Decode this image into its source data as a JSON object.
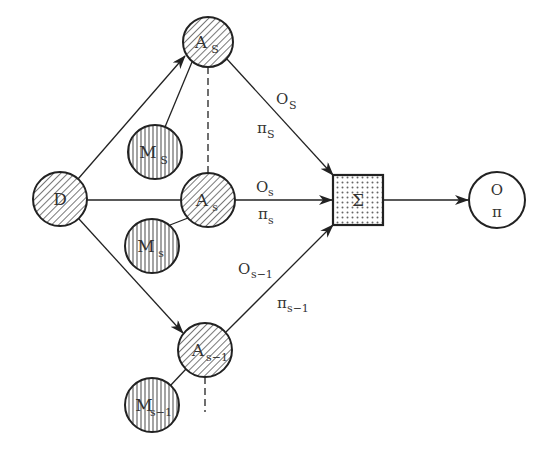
{
  "diagram": {
    "colors": {
      "stroke": "#222222",
      "text": "#333333",
      "background": "#ffffff"
    },
    "nodes": {
      "d": {
        "label": "D"
      },
      "a_top": {
        "label": "A",
        "sub": "S"
      },
      "m_top": {
        "label": "M",
        "sub": "S"
      },
      "a_mid": {
        "label": "A",
        "sub": "s"
      },
      "m_mid": {
        "label": "M",
        "sub": "s"
      },
      "a_bot": {
        "label": "A",
        "sub": "s−1"
      },
      "m_bot": {
        "label": "M",
        "sub": "s−1"
      },
      "sum": {
        "label": "Σ"
      },
      "out": {
        "label_top": "O",
        "label_bottom": "π"
      }
    },
    "edge_labels": {
      "top_o": {
        "label": "O",
        "sub": "S"
      },
      "top_pi": {
        "label": "π",
        "sub": "S"
      },
      "mid_o": {
        "label": "O",
        "sub": "s"
      },
      "mid_pi": {
        "label": "π",
        "sub": "s"
      },
      "bot_o": {
        "label": "O",
        "sub": "s−1"
      },
      "bot_pi": {
        "label": "π",
        "sub": "s−1"
      }
    }
  }
}
